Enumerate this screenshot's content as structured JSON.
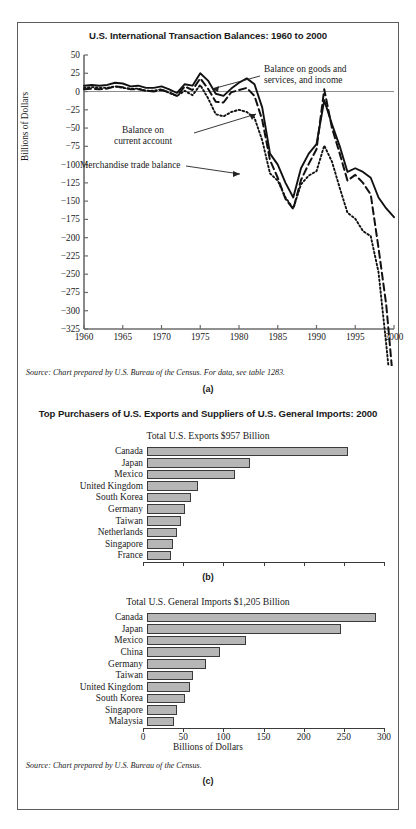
{
  "figure_a": {
    "title": "U.S. International Transaction Balances: 1960 to 2000",
    "ylabel": "Billions of Dollars",
    "source": "Source: Chart prepared by U.S. Bureau of the Census. For data, see table 1283.",
    "panel_label": "(a)",
    "annotations": [
      "Balance on goods and\nservices, and income",
      "Balance on\ncurrent account",
      "Merchandise trade balance"
    ]
  },
  "figure_bc": {
    "title": "Top Purchasers of U.S. Exports and Suppliers of U.S. General Imports: 2000",
    "exports_subtitle": "Total U.S. Exports $957 Billion",
    "imports_subtitle": "Total U.S. General Imports $1,205 Billion",
    "axis_caption": "Billions of Dollars",
    "source": "Source: Chart prepared by U.S. Bureau of the Census.",
    "panel_label_b": "(b)",
    "panel_label_c": "(c)"
  },
  "colors": {
    "bar_fill": "#b6b6b6",
    "bar_stroke": "#3a3a3a",
    "frame": "#5b5b5b",
    "text": "#1a1a1a"
  },
  "chart_data": [
    {
      "type": "line",
      "title": "U.S. International Transaction Balances: 1960 to 2000",
      "xlabel": "",
      "ylabel": "Billions of Dollars",
      "xlim": [
        1960,
        2000
      ],
      "ylim": [
        -325,
        50
      ],
      "xticks": [
        1960,
        1965,
        1970,
        1975,
        1980,
        1985,
        1990,
        1995,
        2000
      ],
      "yticks": [
        50,
        25,
        0,
        -25,
        -50,
        -75,
        -100,
        -125,
        -150,
        -175,
        -200,
        -225,
        -250,
        -275,
        -300,
        -325
      ],
      "grid": false,
      "legend": "inline annotations",
      "x": [
        1960,
        1961,
        1962,
        1963,
        1964,
        1965,
        1966,
        1967,
        1968,
        1969,
        1970,
        1971,
        1972,
        1973,
        1974,
        1975,
        1976,
        1977,
        1978,
        1979,
        1980,
        1981,
        1982,
        1983,
        1984,
        1985,
        1986,
        1987,
        1988,
        1989,
        1990,
        1991,
        1992,
        1993,
        1994,
        1995,
        1996,
        1997,
        1998,
        1999,
        2000
      ],
      "series": [
        {
          "name": "Balance on goods and services, and income",
          "style": "solid",
          "values": [
            8,
            9,
            8,
            9,
            12,
            11,
            7,
            8,
            5,
            5,
            7,
            3,
            -2,
            10,
            8,
            25,
            15,
            -3,
            -6,
            4,
            12,
            18,
            10,
            -22,
            -85,
            -100,
            -125,
            -145,
            -105,
            -85,
            -72,
            -12,
            -45,
            -75,
            -110,
            -105,
            -110,
            -118,
            -145,
            -160,
            -172
          ]
        },
        {
          "name": "Balance on current account",
          "style": "dashed",
          "values": [
            3,
            4,
            3,
            4,
            7,
            6,
            3,
            3,
            1,
            0,
            2,
            -1,
            -6,
            7,
            2,
            18,
            4,
            -14,
            -15,
            -1,
            2,
            5,
            -6,
            -39,
            -94,
            -118,
            -147,
            -161,
            -121,
            -99,
            -79,
            3,
            -50,
            -85,
            -122,
            -114,
            -125,
            -141,
            -214,
            -292,
            -410
          ]
        },
        {
          "name": "Merchandise trade balance",
          "style": "dotted",
          "values": [
            5,
            6,
            5,
            5,
            7,
            5,
            4,
            4,
            1,
            1,
            3,
            -2,
            -6,
            1,
            -5,
            9,
            -9,
            -31,
            -34,
            -28,
            -25,
            -28,
            -36,
            -67,
            -112,
            -122,
            -145,
            -160,
            -127,
            -115,
            -109,
            -74,
            -96,
            -132,
            -166,
            -174,
            -191,
            -198,
            -247,
            -346,
            -452
          ]
        }
      ],
      "annotations": [
        {
          "text": "Balance on goods and services, and income",
          "points_to_year": 1975
        },
        {
          "text": "Balance on current account",
          "points_to_year": 1981
        },
        {
          "text": "Merchandise trade balance",
          "points_to_year": 1984
        }
      ]
    },
    {
      "type": "bar",
      "orientation": "horizontal",
      "title": "Total U.S. Exports $957 Billion",
      "panel": "(b)",
      "xlabel": "Billions of Dollars",
      "ylabel": "",
      "xlim": [
        0,
        300
      ],
      "xticks": [
        0,
        50,
        100,
        150,
        200,
        250,
        300
      ],
      "categories": [
        "Canada",
        "Japan",
        "Mexico",
        "United Kingdom",
        "South Korea",
        "Germany",
        "Taiwan",
        "Netherlands",
        "Singapore",
        "France"
      ],
      "values": [
        254,
        131,
        111,
        65,
        56,
        48,
        43,
        38,
        33,
        31
      ]
    },
    {
      "type": "bar",
      "orientation": "horizontal",
      "title": "Total U.S. General Imports $1,205 Billion",
      "panel": "(c)",
      "xlabel": "Billions of Dollars",
      "ylabel": "",
      "xlim": [
        0,
        300
      ],
      "xticks": [
        0,
        50,
        100,
        150,
        200,
        250,
        300
      ],
      "categories": [
        "Canada",
        "Japan",
        "Mexico",
        "China",
        "Germany",
        "Taiwan",
        "United Kingdom",
        "South Korea",
        "Singapore",
        "Malaysia"
      ],
      "values": [
        290,
        245,
        125,
        93,
        75,
        58,
        54,
        48,
        38,
        34
      ]
    }
  ]
}
